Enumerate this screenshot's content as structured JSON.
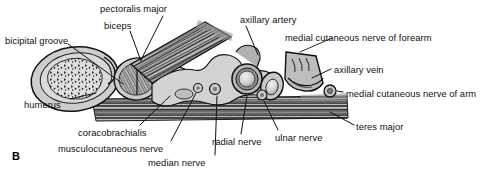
{
  "figure": {
    "panel_letter": "B",
    "background_color": "#ffffff",
    "ink_color": "#111111"
  },
  "labels": [
    {
      "id": "bicipital-groove",
      "text": "bicipital groove",
      "x": 5,
      "y": 36
    },
    {
      "id": "pectoralis-major",
      "text": "pectoralis major",
      "x": 100,
      "y": 4
    },
    {
      "id": "biceps",
      "text": "biceps",
      "x": 104,
      "y": 21
    },
    {
      "id": "axillary-artery",
      "text": "axillary artery",
      "x": 240,
      "y": 15
    },
    {
      "id": "medial-cutaneous-nerve-forearm",
      "text": "medial cutaneous nerve of forearm",
      "x": 285,
      "y": 33
    },
    {
      "id": "axillary-vein",
      "text": "axillary vein",
      "x": 334,
      "y": 65
    },
    {
      "id": "medial-cutaneous-nerve-arm",
      "text": "medial cutaneous nerve of arm",
      "x": 346,
      "y": 89
    },
    {
      "id": "teres-major",
      "text": "teres major",
      "x": 356,
      "y": 122
    },
    {
      "id": "humerus",
      "text": "humerus",
      "x": 24,
      "y": 100
    },
    {
      "id": "coracobrachialis",
      "text": "coracobrachialis",
      "x": 78,
      "y": 128
    },
    {
      "id": "musculocutaneous-nerve",
      "text": "musculocutaneous nerve",
      "x": 58,
      "y": 144
    },
    {
      "id": "median-nerve",
      "text": "median nerve",
      "x": 148,
      "y": 158
    },
    {
      "id": "radial-nerve",
      "text": "radial nerve",
      "x": 212,
      "y": 137
    },
    {
      "id": "ulnar-nerve",
      "text": "ulnar nerve",
      "x": 275,
      "y": 133
    }
  ],
  "structures": [
    {
      "id": "humerus-bone",
      "name": "humerus",
      "kind": "bone"
    },
    {
      "id": "bicipital-groove",
      "name": "bicipital groove",
      "kind": "bone-landmark"
    },
    {
      "id": "biceps-muscle",
      "name": "biceps",
      "kind": "muscle"
    },
    {
      "id": "coracobrachialis",
      "name": "coracobrachialis",
      "kind": "muscle"
    },
    {
      "id": "pectoralis-major",
      "name": "pectoralis major",
      "kind": "muscle"
    },
    {
      "id": "teres-major",
      "name": "teres major",
      "kind": "muscle"
    },
    {
      "id": "axillary-artery",
      "name": "axillary artery",
      "kind": "artery"
    },
    {
      "id": "axillary-vein",
      "name": "axillary vein",
      "kind": "vein"
    },
    {
      "id": "median-nerve",
      "name": "median nerve",
      "kind": "nerve"
    },
    {
      "id": "ulnar-nerve",
      "name": "ulnar nerve",
      "kind": "nerve"
    },
    {
      "id": "radial-nerve",
      "name": "radial nerve",
      "kind": "nerve"
    },
    {
      "id": "musculocutaneous",
      "name": "musculocutaneous nerve",
      "kind": "nerve"
    },
    {
      "id": "mcn-forearm",
      "name": "medial cutaneous nerve of forearm",
      "kind": "nerve"
    },
    {
      "id": "mcn-arm",
      "name": "medial cutaneous nerve of arm",
      "kind": "nerve"
    }
  ]
}
